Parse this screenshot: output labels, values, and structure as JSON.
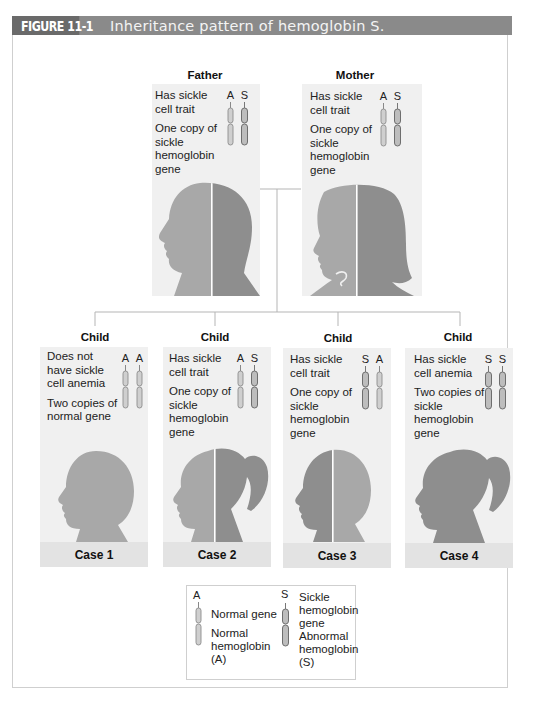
{
  "header": {
    "figure_label": "FIGURE 11-1",
    "title": "Inheritance pattern of hemoglobin S."
  },
  "colors": {
    "header_bg": "#8a8a8a",
    "header_label_bg": "#6a6a6a",
    "panel_bg": "#f0f0f0",
    "case_bar_bg": "#e3e3e3",
    "normal_gray": "#a8a8a8",
    "sickle_gray": "#8e8e8e"
  },
  "parents": [
    {
      "label": "Father",
      "status": "Has sickle cell trait",
      "genes": "One copy of sickle hemoglobin gene",
      "alleles": [
        "A",
        "S"
      ]
    },
    {
      "label": "Mother",
      "status": "Has sickle cell trait",
      "genes": "One copy of sickle hemoglobin gene",
      "alleles": [
        "A",
        "S"
      ]
    }
  ],
  "children": [
    {
      "label": "Child",
      "status": "Does not have sickle cell anemia",
      "genes": "Two copies of normal gene",
      "alleles": [
        "A",
        "A"
      ],
      "case": "Case 1"
    },
    {
      "label": "Child",
      "status": "Has sickle cell trait",
      "genes": "One copy of sickle hemoglobin gene",
      "alleles": [
        "A",
        "S"
      ],
      "case": "Case 2"
    },
    {
      "label": "Child",
      "status": "Has sickle cell trait",
      "genes": "One copy of sickle hemoglobin gene",
      "alleles": [
        "S",
        "A"
      ],
      "case": "Case 3"
    },
    {
      "label": "Child",
      "status": "Has sickle cell anemia",
      "genes": "Two copies of sickle hemoglobin gene",
      "alleles": [
        "S",
        "S"
      ],
      "case": "Case 4"
    }
  ],
  "legend": {
    "normal": {
      "letter": "A",
      "gene_label": "Normal gene",
      "protein_label": "Normal hemoglobin (A)"
    },
    "sickle": {
      "letter": "S",
      "gene_label": "Sickle hemoglobin gene",
      "protein_label": "Abnormal hemoglobin (S)"
    }
  }
}
